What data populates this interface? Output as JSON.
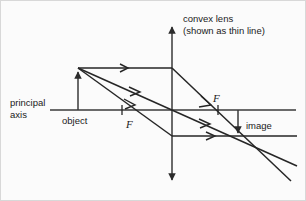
{
  "figure": {
    "width": 306,
    "height": 201,
    "background_color": "#fbfbfb",
    "line_color": "#262626",
    "axis_color": "#3a3a3a"
  },
  "labels": {
    "lens_title": "convex lens",
    "lens_subtitle": "(shown as thin line)",
    "principal_axis_line1": "principal",
    "principal_axis_line2": "axis",
    "object": "object",
    "image": "image",
    "focal_left": "F",
    "focal_right": "F"
  },
  "geometry": {
    "lens_x": 172,
    "axis_y": 110,
    "axis_x_start": 50,
    "axis_x_end": 296,
    "lens_y_top": 20,
    "lens_y_bottom": 187,
    "object_base_x": 78,
    "object_tip_y": 68,
    "focal_left_x": 122,
    "focal_right_x": 218,
    "image_x": 238,
    "image_tip_y": 137
  },
  "optics": {
    "object_height_px": 42,
    "image_height_px": 27,
    "object_distance_px": 94,
    "image_distance_px": 66,
    "focal_length_px": 50,
    "image_orientation": "inverted",
    "image_type": "real",
    "lens_type": "convex"
  },
  "rays": [
    {
      "name": "parallel-ray",
      "description": "parallel to principal axis, refracts through far focal point",
      "segments": [
        {
          "x1": 78,
          "y1": 68,
          "x2": 172,
          "y2": 68
        },
        {
          "x1": 172,
          "y1": 68,
          "x2": 290,
          "y2": 180
        }
      ],
      "arrow_positions": [
        {
          "x": 125,
          "y": 68,
          "angle": 0
        },
        {
          "x": 207,
          "y": 101,
          "angle": 43.5
        }
      ]
    },
    {
      "name": "center-ray",
      "description": "passes undeviated through the optical centre of the lens",
      "segments": [
        {
          "x1": 78,
          "y1": 68,
          "x2": 296,
          "y2": 165
        }
      ],
      "arrow_positions": [
        {
          "x": 135,
          "y": 93,
          "angle": 24
        },
        {
          "x": 205,
          "y": 125,
          "angle": 24
        }
      ]
    },
    {
      "name": "focal-ray",
      "description": "passes through near focal point, emerges parallel to axis",
      "segments": [
        {
          "x1": 78,
          "y1": 68,
          "x2": 172,
          "y2": 136
        },
        {
          "x1": 172,
          "y1": 136,
          "x2": 296,
          "y2": 136
        }
      ],
      "arrow_positions": [
        {
          "x": 130,
          "y": 106,
          "angle": 35.9
        },
        {
          "x": 212,
          "y": 136,
          "angle": 0
        }
      ]
    }
  ],
  "annotations": {
    "focal_ticks": [
      {
        "x": 122,
        "label": "F",
        "side": "below"
      },
      {
        "x": 218,
        "label": "F",
        "side": "above"
      }
    ]
  }
}
